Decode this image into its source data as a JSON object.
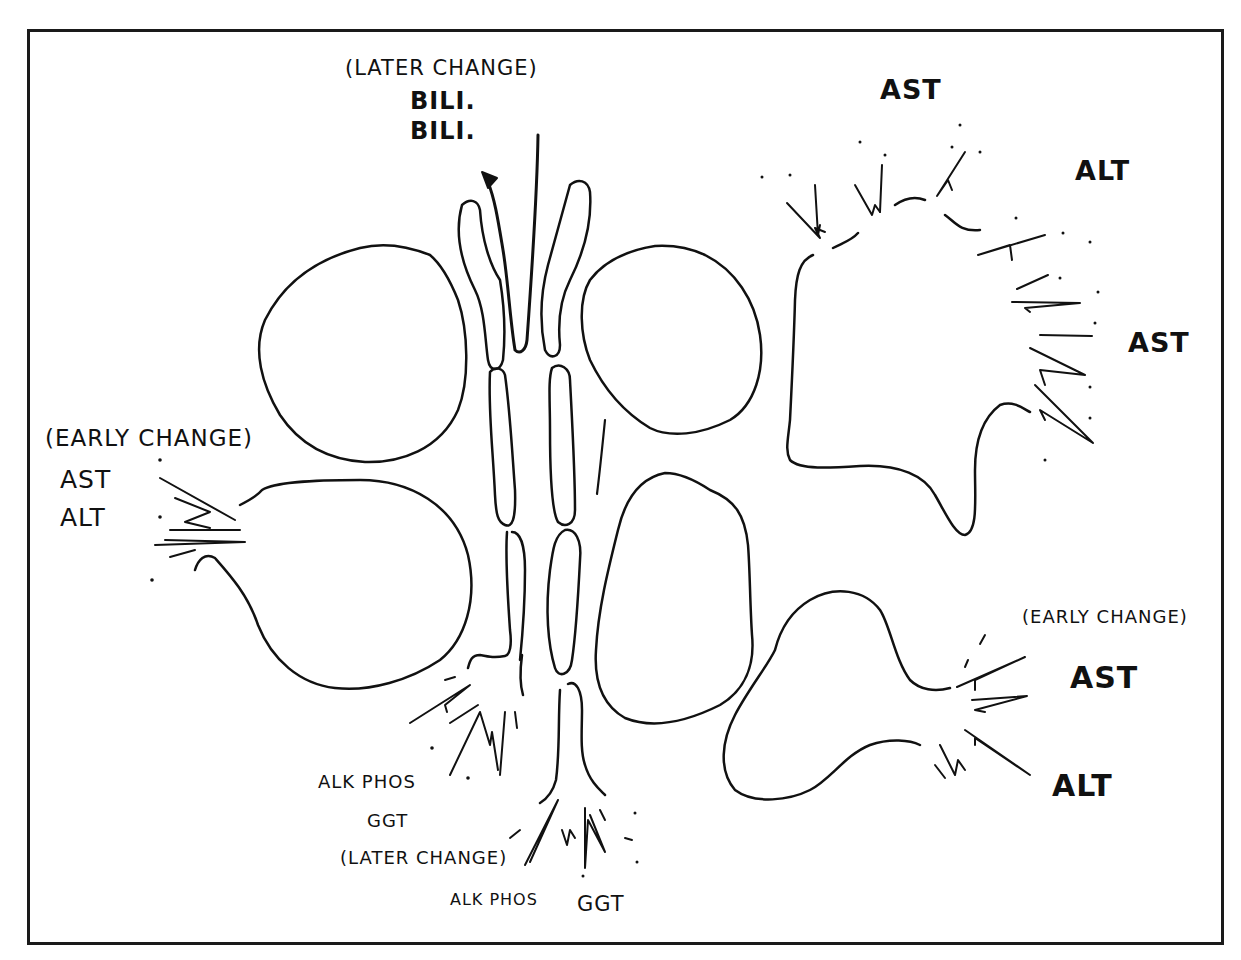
{
  "diagram": {
    "labels": {
      "top_center_note": "(LATER CHANGE)",
      "top_center_bili_1": "BILI.",
      "top_center_bili_2": "BILI.",
      "top_right_ast": "AST",
      "top_right_alt": "ALT",
      "right_ast": "AST",
      "left_note": "(EARLY CHANGE)",
      "left_ast": "AST",
      "left_alt": "ALT",
      "bottom_right_note": "(EARLY CHANGE)",
      "bottom_right_ast": "AST",
      "bottom_right_alt": "ALT",
      "bottom_left_alkphos": "ALK PHOS",
      "bottom_left_ggt": "GGT",
      "bottom_center_note": "(LATER CHANGE)",
      "bottom_center_alkphos": "ALK PHOS",
      "bottom_center_ggt": "GGT"
    },
    "structures": [
      "hepatocyte-upper-left",
      "hepatocyte-lower-left-leaking",
      "hepatocyte-upper-right",
      "hepatocyte-lower-right",
      "hepatocyte-damaged-top-right",
      "hepatocyte-lower-right-leaking",
      "bile-canaliculus-duct",
      "bile-flow-arrow"
    ],
    "colors": {
      "ink": "#111111",
      "background": "#ffffff",
      "frame": "#1a1a1a"
    }
  }
}
